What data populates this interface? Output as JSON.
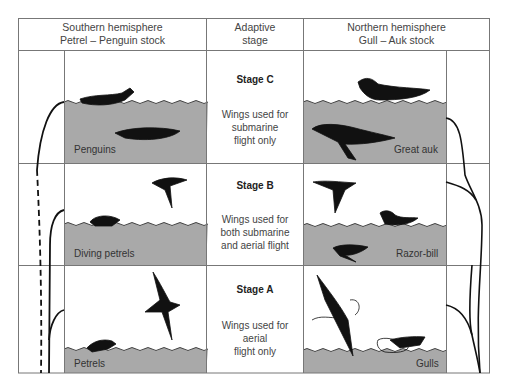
{
  "headers": {
    "left": [
      "Southern hemisphere",
      "Petrel – Penguin stock"
    ],
    "middle": [
      "Adaptive",
      "stage"
    ],
    "right": [
      "Northern hemisphere",
      "Gull – Auk stock"
    ]
  },
  "stages": [
    {
      "title": "Stage C",
      "desc": [
        "Wings used for",
        "submarine",
        "flight only"
      ]
    },
    {
      "title": "Stage B",
      "desc": [
        "Wings used for",
        "both submarine",
        "and aerial flight"
      ]
    },
    {
      "title": "Stage A",
      "desc": [
        "Wings used for",
        "aerial",
        "flight only"
      ]
    }
  ],
  "left_labels": [
    "Penguins",
    "Diving petrels",
    "Petrels"
  ],
  "right_labels": [
    "Great auk",
    "Razor-bill",
    "Gulls"
  ],
  "colors": {
    "water": "#a9a9a9",
    "grid": "#777777",
    "bird": "#111111",
    "lineage": "#111111"
  }
}
